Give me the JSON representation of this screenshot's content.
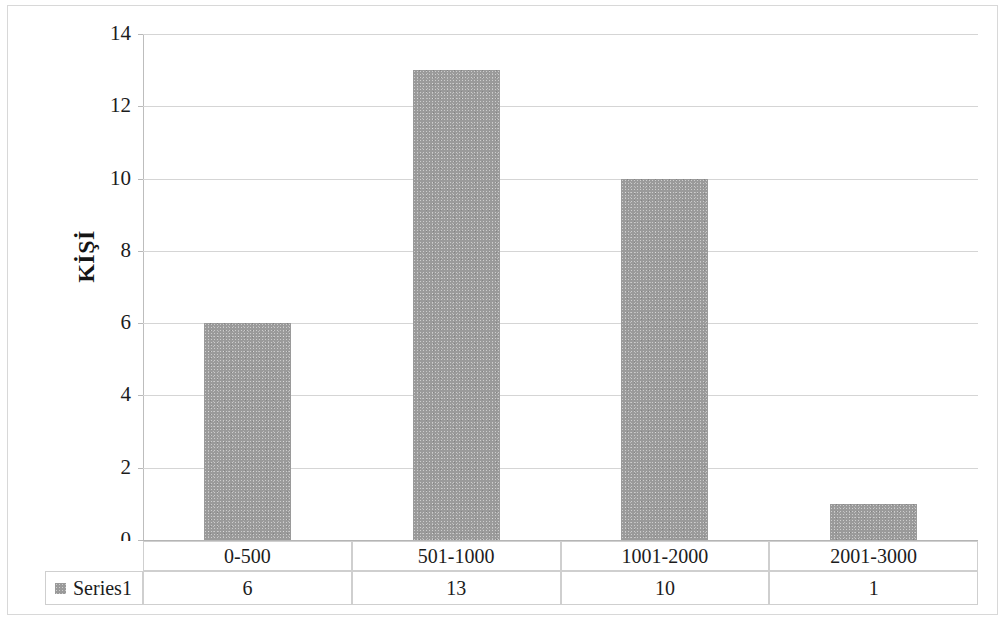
{
  "chart_data": {
    "type": "bar",
    "title": "",
    "xlabel": "",
    "ylabel": "KİŞİ",
    "categories": [
      "0-500",
      "501-1000",
      "1001-2000",
      "2001-3000"
    ],
    "values": [
      6,
      13,
      10,
      1
    ],
    "series": [
      {
        "name": "Series1",
        "values": [
          6,
          13,
          10,
          1
        ]
      }
    ],
    "ylim": [
      0,
      14
    ],
    "ytick_labels": [
      "14",
      "12",
      "10",
      "8",
      "6",
      "4",
      "2",
      "0"
    ],
    "ytick_values": [
      14,
      12,
      10,
      8,
      6,
      4,
      2,
      0
    ],
    "grid": true,
    "legend_position": "data-table",
    "bar_color": "#9a9a9a",
    "gridline_color": "#d5d5d5",
    "axis_color": "#bdbdbd",
    "text_color": "#1c1c1c"
  },
  "axis": {
    "y_title": "KİŞİ"
  },
  "data_table": {
    "legend_label": "Series1",
    "legend_swatch_color": "#9a9a9a",
    "category_row": [
      "0-500",
      "501-1000",
      "1001-2000",
      "2001-3000"
    ],
    "value_row": [
      "6",
      "13",
      "10",
      "1"
    ]
  }
}
